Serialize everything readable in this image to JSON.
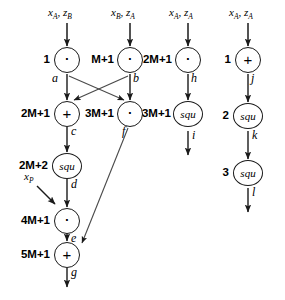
{
  "diagram": {
    "background_color": "#ffffff",
    "line_color": "#1a1a1a",
    "inputs": [
      {
        "id": "in-ab",
        "text": "xA, zB",
        "x_var": "x",
        "x_sub": "A",
        "z_var": "z",
        "z_sub": "B"
      },
      {
        "id": "in-ba",
        "text": "xB, zA",
        "x_var": "x",
        "x_sub": "B",
        "z_var": "z",
        "z_sub": "A"
      },
      {
        "id": "in-aa-1",
        "text": "xA, zA",
        "x_var": "x",
        "x_sub": "A",
        "z_var": "z",
        "z_sub": "A"
      },
      {
        "id": "in-aa-2",
        "text": "xA, zA",
        "x_var": "x",
        "x_sub": "A",
        "z_var": "z",
        "z_sub": "A"
      },
      {
        "id": "in-xp",
        "text": "xP",
        "x_var": "x",
        "x_sub": "P",
        "z_var": "",
        "z_sub": ""
      }
    ],
    "nodes": [
      {
        "id": "a",
        "op": "mul",
        "symbol": "·",
        "step": "1",
        "edge": "a"
      },
      {
        "id": "b",
        "op": "mul",
        "symbol": "·",
        "step": "M+1",
        "edge": "b"
      },
      {
        "id": "h",
        "op": "mul",
        "symbol": "·",
        "step": "2M+1",
        "edge": "h"
      },
      {
        "id": "j",
        "op": "add",
        "symbol": "+",
        "step": "1",
        "edge": "j"
      },
      {
        "id": "c",
        "op": "add",
        "symbol": "+",
        "step": "2M+1",
        "edge": "c"
      },
      {
        "id": "f",
        "op": "mul",
        "symbol": "·",
        "step": "3M+1",
        "edge": "f"
      },
      {
        "id": "i",
        "op": "squ",
        "symbol": "squ",
        "step": "3M+1",
        "edge": "i"
      },
      {
        "id": "k",
        "op": "squ",
        "symbol": "squ",
        "step": "2",
        "edge": "k"
      },
      {
        "id": "d",
        "op": "squ",
        "symbol": "squ",
        "step": "2M+2",
        "edge": "d"
      },
      {
        "id": "l",
        "op": "squ",
        "symbol": "squ",
        "step": "3",
        "edge": "l"
      },
      {
        "id": "e",
        "op": "mul",
        "symbol": "·",
        "step": "4M+1",
        "edge": "e"
      },
      {
        "id": "g",
        "op": "add",
        "symbol": "+",
        "step": "5M+1",
        "edge": "g"
      }
    ],
    "edges": [
      {
        "from": "in-ab",
        "to": "a"
      },
      {
        "from": "in-ba",
        "to": "b"
      },
      {
        "from": "in-aa-1",
        "to": "h"
      },
      {
        "from": "in-aa-2",
        "to": "j"
      },
      {
        "from": "a",
        "to": "c"
      },
      {
        "from": "a",
        "to": "f"
      },
      {
        "from": "b",
        "to": "f"
      },
      {
        "from": "b",
        "to": "c"
      },
      {
        "from": "c",
        "to": "d"
      },
      {
        "from": "d",
        "to": "e"
      },
      {
        "from": "in-xp",
        "to": "e"
      },
      {
        "from": "e",
        "to": "g"
      },
      {
        "from": "f",
        "to": "g"
      },
      {
        "from": "g",
        "to": "out-g"
      },
      {
        "from": "h",
        "to": "i"
      },
      {
        "from": "i",
        "to": "out-i"
      },
      {
        "from": "j",
        "to": "k"
      },
      {
        "from": "k",
        "to": "l"
      },
      {
        "from": "l",
        "to": "out-l"
      }
    ]
  }
}
